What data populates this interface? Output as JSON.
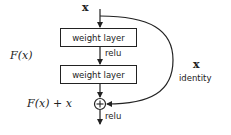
{
  "diagram": {
    "input_label": "x",
    "layers": [
      {
        "label": "weight layer"
      },
      {
        "label": "weight layer"
      }
    ],
    "activation_between": "relu",
    "activation_after": "relu",
    "residual_function_label": "F(x)",
    "sum_label": "F(x) + x",
    "sum_operator": "⊕",
    "shortcut": {
      "variable": "x",
      "label": "identity"
    }
  }
}
